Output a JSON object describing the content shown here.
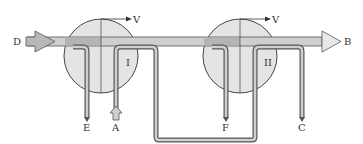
{
  "diagram": {
    "type": "heat-exchanger-flow-schematic",
    "units": [
      {
        "id": "I",
        "label": "I",
        "rotation_label": "V"
      },
      {
        "id": "II",
        "label": "II",
        "rotation_label": "V"
      }
    ],
    "streams": {
      "D": "D",
      "B": "B",
      "E": "E",
      "A": "A",
      "F": "F",
      "C": "C"
    },
    "colors": {
      "circle_fill": "#e4e4e4",
      "main_pipe": "#c8c8c8",
      "pipe_stroke": "#555555",
      "outline": "#333333"
    }
  }
}
